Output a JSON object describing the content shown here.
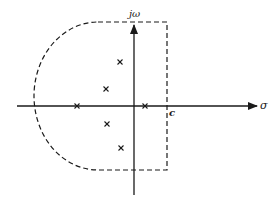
{
  "diagram": {
    "axes": {
      "horizontal_label": "σ",
      "vertical_label": "jω",
      "point_label": "c"
    },
    "poles": [
      {
        "x": 120,
        "y": 62
      },
      {
        "x": 106,
        "y": 89
      },
      {
        "x": 77,
        "y": 106
      },
      {
        "x": 145,
        "y": 106
      },
      {
        "x": 107,
        "y": 124
      },
      {
        "x": 121,
        "y": 148
      }
    ],
    "contour": {
      "style": "dashed",
      "top_y": 22,
      "bottom_y": 170,
      "right_x": 167,
      "arc_left_x": 34,
      "arc_join_x": 98
    },
    "colors": {
      "ink": "#1a1a1a",
      "background": "#ffffff"
    }
  }
}
